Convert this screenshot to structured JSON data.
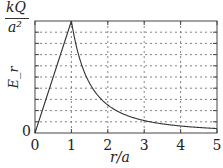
{
  "chart_data": {
    "type": "line",
    "title": "",
    "xlabel": "r/a",
    "ylabel": "E_r",
    "y_top_label_num": "kQ",
    "y_top_label_den": "a²",
    "y_bottom_label": "0",
    "xlim": [
      0,
      5
    ],
    "ylim": [
      0,
      1
    ],
    "x_ticks": [
      "0",
      "1",
      "2",
      "3",
      "4",
      "5"
    ],
    "y_gridlines": [
      0.1,
      0.2,
      0.3,
      0.4,
      0.5,
      0.6,
      0.7,
      0.8,
      0.9
    ],
    "x_gridlines": [
      1,
      2,
      3,
      4
    ],
    "grid": true,
    "series": [
      {
        "name": "E_r",
        "description": "linear rise E=r/a for r<a, then 1/r² decay for r>a",
        "x": [
          0,
          1,
          1.25,
          1.5,
          2,
          2.5,
          3,
          3.5,
          4,
          4.5,
          5
        ],
        "y": [
          0,
          1,
          0.64,
          0.444,
          0.25,
          0.16,
          0.111,
          0.082,
          0.0625,
          0.049,
          0.04
        ]
      }
    ]
  },
  "colors": {
    "line": "#333333",
    "grid": "#555555",
    "frame": "#444444",
    "text": "#222222"
  }
}
